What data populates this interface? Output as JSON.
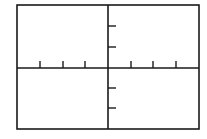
{
  "graph": {
    "title": "",
    "frame": {
      "x1": 17,
      "y1": 5,
      "x2": 199,
      "y2": 129
    },
    "origin": {
      "x": 108,
      "y": 68
    },
    "colors": {
      "background": "#ffffff",
      "stroke": "#1a1a1a"
    },
    "x_axis": {
      "label": "",
      "tick_direction": "up",
      "tick_length": 7,
      "ticks_px": [
        40,
        63,
        85,
        131,
        153,
        176
      ],
      "tick_labels": []
    },
    "y_axis": {
      "label": "",
      "tick_direction": "right",
      "tick_length": 8,
      "ticks_px": [
        26,
        47,
        88,
        108
      ],
      "tick_labels": []
    }
  },
  "chart_data": {
    "type": "scatter",
    "title": "",
    "xlabel": "",
    "ylabel": "",
    "series": [],
    "x_ticks": [
      -3,
      -2,
      -1,
      1,
      2,
      3
    ],
    "y_ticks": [
      2,
      1,
      -1,
      -2
    ],
    "xlim": [
      -4,
      4
    ],
    "ylim": [
      -3,
      3
    ],
    "grid": false,
    "legend": "none",
    "note": "Blank coordinate window with axes and unlabeled tick marks"
  }
}
